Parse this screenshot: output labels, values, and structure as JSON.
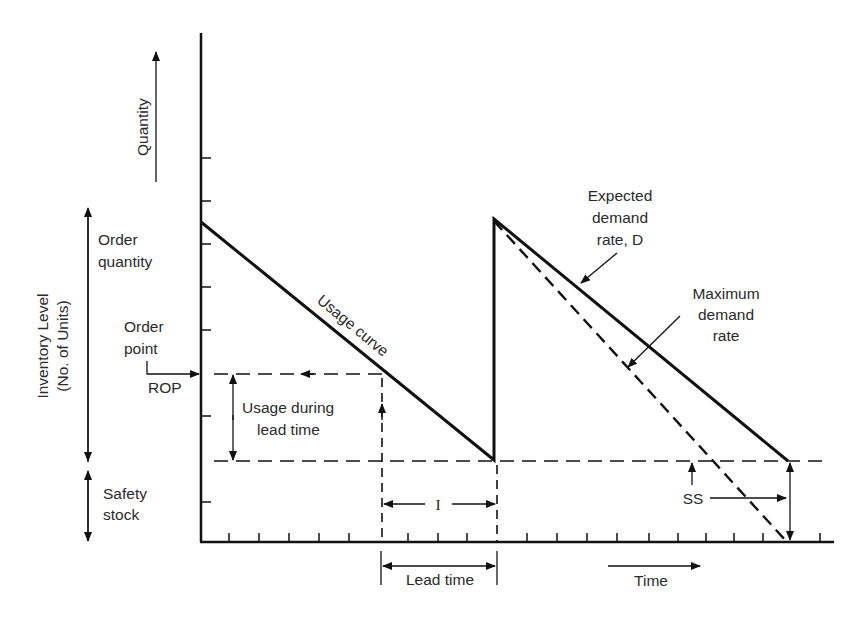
{
  "diagram": {
    "type": "inventory-reorder-point-model",
    "colors": {
      "ink": "#111111",
      "text": "#2a2a2a",
      "background": "#ffffff"
    },
    "labels": {
      "quantity": "Quantity",
      "inventory_level_line1": "Inventory Level",
      "inventory_level_line2": "(No. of Units)",
      "order_quantity_line1": "Order",
      "order_quantity_line2": "quantity",
      "order_point_line1": "Order",
      "order_point_line2": "point",
      "rop": "ROP",
      "safety_stock_line1": "Safety",
      "safety_stock_line2": "stock",
      "usage_curve": "Usage curve",
      "usage_during_lead_time_line1": "Usage during",
      "usage_during_lead_time_line2": "lead time",
      "expected_demand_line1": "Expected",
      "expected_demand_line2": "demand",
      "expected_demand_line3": "rate, D",
      "maximum_demand_line1": "Maximum",
      "maximum_demand_line2": "demand",
      "maximum_demand_line3": "rate",
      "interval": "I",
      "lead_time": "Lead time",
      "time": "Time",
      "ss": "SS"
    },
    "levels": {
      "order_quantity_peak": "top of sawtooth",
      "reorder_point": "ROP",
      "safety_stock": "SS"
    }
  }
}
